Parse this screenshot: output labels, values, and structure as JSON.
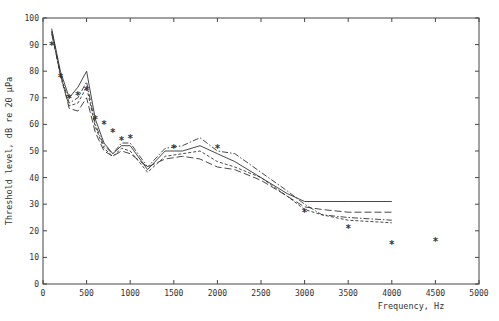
{
  "chart_data": {
    "type": "line",
    "title": "",
    "xlabel": "Frequency, Hz",
    "ylabel": "Threshold level, dB re 20 μPa",
    "xlim": [
      0,
      5000
    ],
    "ylim": [
      0,
      100
    ],
    "xticks": [
      0,
      500,
      1000,
      1500,
      2000,
      2500,
      3000,
      3500,
      4000,
      4500,
      5000
    ],
    "yticks": [
      0,
      10,
      20,
      30,
      40,
      50,
      60,
      70,
      80,
      90,
      100
    ],
    "grid": false,
    "legend": null,
    "series": [
      {
        "name": "solid",
        "style": "solid",
        "x": [
          100,
          200,
          300,
          400,
          500,
          600,
          700,
          800,
          900,
          1000,
          1200,
          1400,
          1600,
          1800,
          2000,
          2200,
          2500,
          2800,
          3000,
          3200,
          3500,
          4000
        ],
        "values": [
          96,
          80,
          70,
          74,
          80,
          62,
          53,
          49,
          52,
          52,
          43,
          50,
          50,
          52,
          49,
          46,
          40,
          34,
          31,
          31,
          31,
          31
        ]
      },
      {
        "name": "long-dash",
        "style": "dash",
        "x": [
          100,
          200,
          300,
          400,
          500,
          600,
          700,
          800,
          900,
          1000,
          1200,
          1400,
          1600,
          1800,
          2000,
          2200,
          2500,
          2800,
          3000,
          3200,
          3500,
          4000
        ],
        "values": [
          94,
          79,
          66,
          65,
          70,
          57,
          50,
          48,
          50,
          49,
          44,
          47,
          48,
          47,
          44,
          43,
          39,
          33,
          29,
          28,
          27,
          27
        ]
      },
      {
        "name": "dash-dot",
        "style": "dashdot",
        "x": [
          100,
          200,
          300,
          400,
          500,
          600,
          700,
          800,
          900,
          1000,
          1200,
          1400,
          1600,
          1800,
          2000,
          2200,
          2500,
          2800,
          3000,
          3200,
          3500,
          4000
        ],
        "values": [
          95,
          79,
          68,
          70,
          76,
          60,
          52,
          49,
          53,
          53,
          44,
          51,
          52,
          55,
          50,
          49,
          42,
          35,
          30,
          26,
          25,
          24
        ]
      },
      {
        "name": "dotted-dash",
        "style": "shortdash",
        "x": [
          100,
          200,
          300,
          400,
          500,
          600,
          700,
          800,
          900,
          1000,
          1200,
          1400,
          1600,
          1800,
          2000,
          2200,
          2500,
          2800,
          3000,
          3200,
          3500,
          4000
        ],
        "values": [
          95,
          78,
          67,
          68,
          74,
          59,
          51,
          48,
          51,
          50,
          42,
          48,
          49,
          50,
          46,
          44,
          40,
          33,
          28,
          26,
          24,
          23
        ]
      }
    ],
    "markers": {
      "name": "asterisk",
      "x": [
        100,
        200,
        300,
        400,
        500,
        600,
        700,
        800,
        900,
        1000,
        1500,
        2000,
        3000,
        3500,
        4000,
        4500
      ],
      "values": [
        90,
        78,
        70,
        71,
        73,
        62,
        60,
        57,
        54,
        55,
        51,
        51,
        27,
        21,
        15,
        16
      ]
    }
  }
}
